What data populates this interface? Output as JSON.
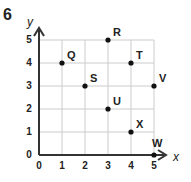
{
  "question_number": "6",
  "chart_data": {
    "type": "scatter",
    "title": "",
    "xlabel": "x",
    "ylabel": "y",
    "xlim": [
      0,
      5
    ],
    "ylim": [
      0,
      5
    ],
    "grid": true,
    "x_ticks": [
      "0",
      "1",
      "2",
      "3",
      "4",
      "5"
    ],
    "y_ticks": [
      "0",
      "1",
      "2",
      "3",
      "4",
      "5"
    ],
    "points": [
      {
        "label": "Q",
        "x": 1,
        "y": 4
      },
      {
        "label": "R",
        "x": 3,
        "y": 5
      },
      {
        "label": "S",
        "x": 2,
        "y": 3
      },
      {
        "label": "T",
        "x": 4,
        "y": 4
      },
      {
        "label": "U",
        "x": 3,
        "y": 2
      },
      {
        "label": "V",
        "x": 5,
        "y": 3
      },
      {
        "label": "W",
        "x": 5,
        "y": 0
      },
      {
        "label": "X",
        "x": 4,
        "y": 1
      }
    ]
  },
  "colors": {
    "axis": "#333333",
    "grid": "#cccccc",
    "point": "#111111",
    "text": "#222222"
  }
}
